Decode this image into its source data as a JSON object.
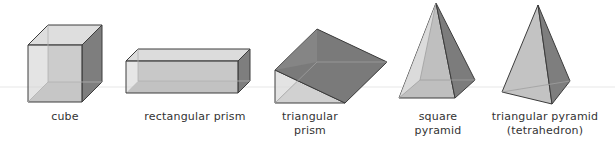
{
  "figure": {
    "shapes": [
      {
        "id": "cube",
        "label": "cube"
      },
      {
        "id": "rectangular-prism",
        "label": "rectangular prism"
      },
      {
        "id": "triangular-prism",
        "label_line1": "triangular",
        "label_line2": "prism"
      },
      {
        "id": "square-pyramid",
        "label_line1": "square",
        "label_line2": "pyramid"
      },
      {
        "id": "triangular-pyramid",
        "label_line1": "triangular pyramid",
        "label_line2": "(tetrahedron)"
      }
    ],
    "colors": {
      "edge": "#3c3c3c",
      "face_light": "#d9d9d9",
      "face_mid": "#bdbdbd",
      "face_dark": "#8a8a8a",
      "face_darker": "#767676",
      "hidden_edge": "#a8a8a8"
    }
  }
}
